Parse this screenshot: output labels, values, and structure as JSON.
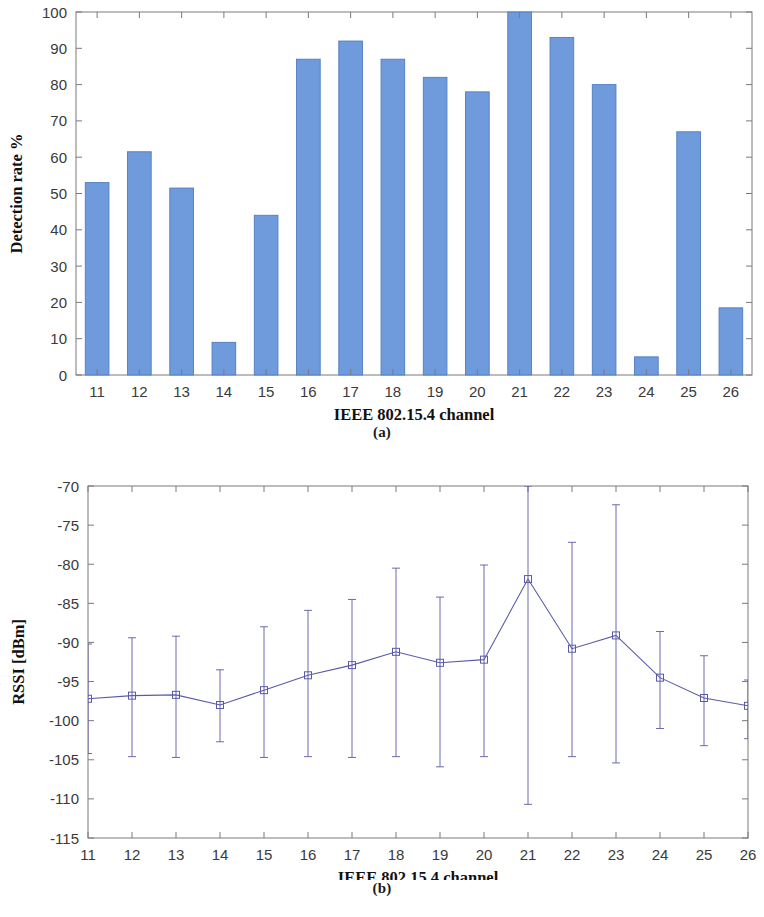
{
  "figure": {
    "panel_a_caption": "(a)",
    "panel_b_caption": "(b)"
  },
  "colors": {
    "bar_fill": "#6f9bdd",
    "bar_edge": "#4f7cc0",
    "line": "#5a5aa8",
    "marker_edge": "#5a5aa8",
    "axis": "#7a7a7a",
    "grid": "#d9d9d9",
    "tick_text": "#3a3a3a",
    "title_text": "#111111"
  },
  "chart_data": [
    {
      "type": "bar",
      "title": "",
      "xlabel": "IEEE 802.15.4 channel",
      "ylabel": "Detection rate %",
      "categories": [
        "11",
        "12",
        "13",
        "14",
        "15",
        "16",
        "17",
        "18",
        "19",
        "20",
        "21",
        "22",
        "23",
        "24",
        "25",
        "26"
      ],
      "values": [
        53,
        61.5,
        51.5,
        9,
        44,
        87,
        92,
        87,
        82,
        78,
        100,
        93,
        80,
        5,
        67,
        18.5
      ],
      "ylim": [
        0,
        100
      ],
      "yticks": [
        0,
        10,
        20,
        30,
        40,
        50,
        60,
        70,
        80,
        90,
        100
      ],
      "ytick_labels": [
        "0",
        "10",
        "20",
        "30",
        "40",
        "50",
        "60",
        "70",
        "80",
        "90",
        "100"
      ],
      "xtick_labels": [
        "11",
        "12",
        "13",
        "14",
        "15",
        "16",
        "17",
        "18",
        "19",
        "20",
        "21",
        "22",
        "23",
        "24",
        "25",
        "26"
      ],
      "grid": false,
      "legend": null
    },
    {
      "type": "line",
      "title": "",
      "xlabel": "IEEE 802.15.4 channel",
      "ylabel": "RSSI [dBm]",
      "x": [
        11,
        12,
        13,
        14,
        15,
        16,
        17,
        18,
        19,
        20,
        21,
        22,
        23,
        24,
        25,
        26
      ],
      "xtick_labels": [
        "11",
        "12",
        "13",
        "14",
        "15",
        "16",
        "17",
        "18",
        "19",
        "20",
        "21",
        "22",
        "23",
        "24",
        "25",
        "26"
      ],
      "values": [
        -97.2,
        -96.8,
        -96.7,
        -98.0,
        -96.1,
        -94.2,
        -92.9,
        -91.2,
        -92.6,
        -92.2,
        -81.9,
        -90.8,
        -89.1,
        -94.5,
        -97.1,
        -98.1
      ],
      "err_upper": [
        -90.2,
        -89.4,
        -89.2,
        -93.5,
        -88.0,
        -85.9,
        -84.5,
        -80.5,
        -84.2,
        -80.1,
        -70.0,
        -77.2,
        -72.4,
        -88.6,
        -91.7,
        -94.8
      ],
      "err_lower": [
        -104.2,
        -104.6,
        -104.7,
        -102.7,
        -104.7,
        -104.6,
        -104.7,
        -104.6,
        -105.9,
        -104.6,
        -110.7,
        -104.6,
        -105.4,
        -101.0,
        -103.2,
        -102.3
      ],
      "ylim": [
        -115,
        -70
      ],
      "yticks": [
        -115,
        -110,
        -105,
        -100,
        -95,
        -90,
        -85,
        -80,
        -75,
        -70
      ],
      "ytick_labels": [
        "-115",
        "-110",
        "-105",
        "-100",
        "-95",
        "-90",
        "-85",
        "-80",
        "-75",
        "-70"
      ],
      "marker": "square",
      "grid": false,
      "legend": null
    }
  ]
}
